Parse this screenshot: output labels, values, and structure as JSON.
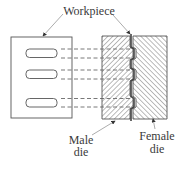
{
  "diagram": {
    "labels": {
      "workpiece": "Workpiece",
      "male_die_line1": "Male",
      "male_die_line2": "die",
      "female_die_line1": "Female",
      "female_die_line2": "die"
    },
    "colors": {
      "stroke": "#555555",
      "hatch": "#777777",
      "text": "#3a3a3a"
    },
    "workpiece_slots": 3,
    "projection_lines": 6
  }
}
